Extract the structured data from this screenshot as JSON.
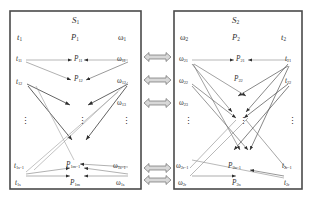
{
  "figure": {
    "kind": "bipartite-network-diagram",
    "caption": "",
    "colors": {
      "frame": "#4a4a4a",
      "edge_light": "#9a9a9a",
      "edge_dark": "#3a3a3a",
      "connector": "#6f6f6f",
      "text": "#2f2f2f"
    }
  },
  "panels": [
    {
      "id": "S1",
      "title": "S",
      "title_sub": "1",
      "columns": {
        "left": {
          "label": "t",
          "sub": "1"
        },
        "middle": {
          "label": "P",
          "sub": "1"
        },
        "right": {
          "label": "ω",
          "sub": "1"
        }
      },
      "left_nodes": [
        {
          "label": "t",
          "sub": "11"
        },
        {
          "label": "t",
          "sub": "12"
        },
        {
          "label": "t",
          "sub": "1s−1"
        },
        {
          "label": "t",
          "sub": "1s"
        }
      ],
      "middle_nodes": [
        {
          "label": "P",
          "sub": "11"
        },
        {
          "label": "P",
          "sub": "12"
        },
        {
          "label": "P",
          "sub": "1m−1"
        },
        {
          "label": "P",
          "sub": "1m"
        }
      ],
      "right_nodes": [
        {
          "label": "ω",
          "sub": "11"
        },
        {
          "label": "ω",
          "sub": "12"
        },
        {
          "label": "ω",
          "sub": "13"
        },
        {
          "label": "ω",
          "sub": "1s−1"
        },
        {
          "label": "ω",
          "sub": "1s"
        }
      ],
      "ellipses": [
        "⋮",
        "⋮",
        "⋮"
      ]
    },
    {
      "id": "S2",
      "title": "S",
      "title_sub": "2",
      "columns": {
        "left": {
          "label": "ω",
          "sub": "2"
        },
        "middle": {
          "label": "P",
          "sub": "2"
        },
        "right": {
          "label": "t",
          "sub": "2"
        }
      },
      "left_nodes": [
        {
          "label": "ω",
          "sub": "21"
        },
        {
          "label": "ω",
          "sub": "22"
        },
        {
          "label": "ω",
          "sub": "23"
        },
        {
          "label": "ω",
          "sub": "2r−1"
        },
        {
          "label": "ω",
          "sub": "2r"
        }
      ],
      "middle_nodes": [
        {
          "label": "P",
          "sub": "21"
        },
        {
          "label": "P",
          "sub": "22"
        },
        {
          "label": "P",
          "sub": "2n−1"
        },
        {
          "label": "P",
          "sub": "2n"
        }
      ],
      "right_nodes": [
        {
          "label": "t",
          "sub": "21"
        },
        {
          "label": "t",
          "sub": "22"
        },
        {
          "label": "t",
          "sub": "2r−1"
        },
        {
          "label": "t",
          "sub": "2r"
        }
      ],
      "ellipses": [
        "⋮",
        "⋮",
        "⋮"
      ]
    }
  ],
  "connectors": {
    "type": "double-headed-block-arrow",
    "count": 5
  }
}
